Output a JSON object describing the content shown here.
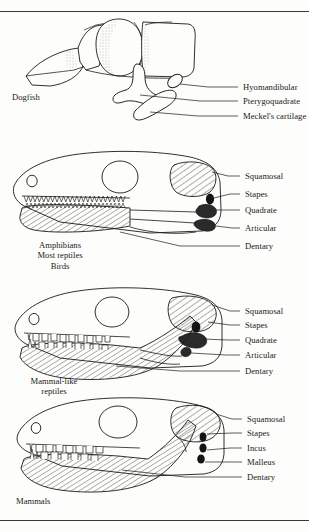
{
  "figure": {
    "background_color": "#fdfdfb",
    "ink_color": "#1a1a1a",
    "panels": [
      {
        "id": "dogfish",
        "group_label": "Dogfish",
        "group_label_lines": [
          "Dogfish"
        ],
        "labels": [
          {
            "id": "hyomandibular",
            "text": "Hyomandibular"
          },
          {
            "id": "pterygoquadrate",
            "text": "Pterygoquadrate"
          },
          {
            "id": "meckels-cartilage",
            "text": "Meckel's cartilage"
          }
        ]
      },
      {
        "id": "amphibians",
        "group_label": "Amphibians Most reptiles Birds",
        "group_label_lines": [
          "Amphibians",
          "Most reptiles",
          "Birds"
        ],
        "labels": [
          {
            "id": "squamosal",
            "text": "Squamosal"
          },
          {
            "id": "stapes",
            "text": "Stapes"
          },
          {
            "id": "quadrate",
            "text": "Quadrate"
          },
          {
            "id": "articular",
            "text": "Articular"
          },
          {
            "id": "dentary",
            "text": "Dentary"
          }
        ]
      },
      {
        "id": "mammal-like-reptiles",
        "group_label": "Mammal-like reptiles",
        "group_label_lines": [
          "Mammal-like",
          "reptiles"
        ],
        "labels": [
          {
            "id": "squamosal",
            "text": "Squamosal"
          },
          {
            "id": "stapes",
            "text": "Stapes"
          },
          {
            "id": "quadrate",
            "text": "Quadrate"
          },
          {
            "id": "articular",
            "text": "Articular"
          },
          {
            "id": "dentary",
            "text": "Dentary"
          }
        ]
      },
      {
        "id": "mammals",
        "group_label": "Mammals",
        "group_label_lines": [
          "Mammals"
        ],
        "labels": [
          {
            "id": "squamosal",
            "text": "Squamosal"
          },
          {
            "id": "stapes",
            "text": "Stapes"
          },
          {
            "id": "incus",
            "text": "Incus"
          },
          {
            "id": "malleus",
            "text": "Malleus"
          },
          {
            "id": "dentary",
            "text": "Dentary"
          }
        ]
      }
    ]
  }
}
